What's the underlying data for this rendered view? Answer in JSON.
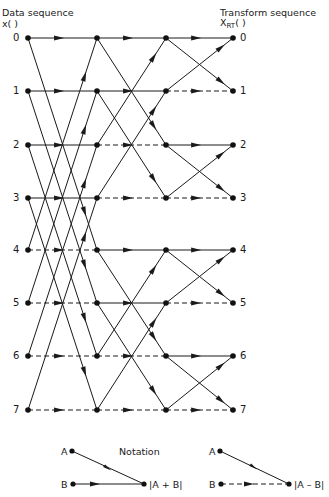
{
  "header": {
    "left_title": "Data sequence",
    "left_symbol": "x(   )",
    "right_title": "Transform sequence",
    "right_symbol_main": "X",
    "right_symbol_sub": "RT",
    "right_symbol_paren": "(   )"
  },
  "indices": [
    "0",
    "1",
    "2",
    "3",
    "4",
    "5",
    "6",
    "7"
  ],
  "layout": {
    "columns_x": [
      28,
      97,
      166,
      233
    ],
    "rows_y": [
      38,
      91,
      145,
      198,
      250,
      303,
      356,
      410
    ]
  },
  "stages": [
    {
      "name": "stage-1",
      "span": 4,
      "horizontal_style": [
        "solid",
        "solid",
        "solid",
        "solid",
        "dashed",
        "dashed",
        "dashed",
        "dashed"
      ]
    },
    {
      "name": "stage-2",
      "span": 2,
      "horizontal_style": [
        "solid",
        "solid",
        "dashed",
        "dashed",
        "solid",
        "solid",
        "dashed",
        "dashed"
      ]
    },
    {
      "name": "stage-3",
      "span": 1,
      "horizontal_style": [
        "solid",
        "dashed",
        "solid",
        "dashed",
        "solid",
        "dashed",
        "solid",
        "dashed"
      ]
    }
  ],
  "notation": {
    "title": "Notation",
    "sum": {
      "a": "A",
      "b": "B",
      "result": "|A + B|"
    },
    "difference": {
      "a": "A",
      "b": "B",
      "result": "|A – B|"
    }
  },
  "colors": {
    "line": "#1a1a1a",
    "background": "#ffffff"
  }
}
